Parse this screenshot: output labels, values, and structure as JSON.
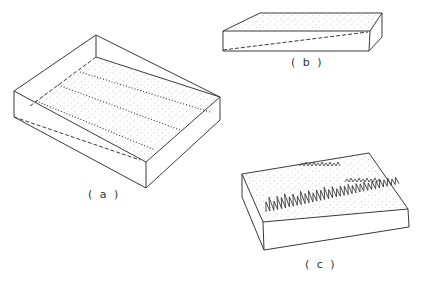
{
  "figure": {
    "panels": [
      {
        "id": "a",
        "label": "( a )",
        "description": "Shallow open tray with stippled surface, three dotted lines across surface and dashed sloping line on side"
      },
      {
        "id": "b",
        "label": "( b )",
        "description": "Thin slab with stippled top and dashed sloping line on front face"
      },
      {
        "id": "c",
        "label": "( c )",
        "description": "Slab with stippled top surface and three rows of grass-like vegetation"
      }
    ]
  },
  "colors": {
    "line": "#3a3a3a",
    "background": "#ffffff",
    "stipple": "#888888"
  }
}
